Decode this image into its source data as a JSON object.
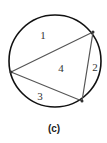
{
  "figure": {
    "caption": "(c)",
    "circle": {
      "cx": 55,
      "cy": 61,
      "r": 46
    },
    "vertices": [
      {
        "x": 11,
        "y": 72
      },
      {
        "x": 93,
        "y": 32
      },
      {
        "x": 82,
        "y": 101
      }
    ],
    "regions": [
      {
        "label": "1",
        "x": 43,
        "y": 35
      },
      {
        "label": "2",
        "x": 95,
        "y": 67
      },
      {
        "label": "3",
        "x": 40,
        "y": 96
      },
      {
        "label": "4",
        "x": 61,
        "y": 68
      }
    ],
    "colors": {
      "circle": "#111111",
      "triangle": "#555555"
    }
  }
}
